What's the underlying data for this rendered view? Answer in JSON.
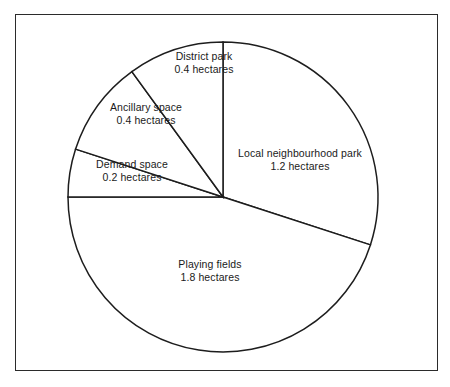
{
  "figure": {
    "caption": "",
    "units": "hectares",
    "frame": true
  },
  "chart_data": {
    "type": "pie",
    "title": "",
    "xlabel": "",
    "ylabel": "",
    "unit": "hectares",
    "total": 4.0,
    "start_angle_deg": 0,
    "direction": "clockwise",
    "legend": "none",
    "grid": false,
    "categories": [
      "Local neighbourhood park",
      "Playing fields",
      "Demand space",
      "Ancillary space",
      "District park"
    ],
    "values": [
      1.2,
      1.8,
      0.2,
      0.4,
      0.4
    ],
    "slices": [
      {
        "name": "Local neighbourhood park",
        "value": 1.2,
        "value_label": "1.2 hectares",
        "share_pct": 30,
        "angle_deg": 108,
        "start_deg": 0,
        "end_deg": 108,
        "color": "#ffffff"
      },
      {
        "name": "Playing fields",
        "value": 1.8,
        "value_label": "1.8 hectares",
        "share_pct": 45,
        "angle_deg": 162,
        "start_deg": 108,
        "end_deg": 270,
        "color": "#ffffff"
      },
      {
        "name": "Demand space",
        "value": 0.2,
        "value_label": "0.2 hectares",
        "share_pct": 5,
        "angle_deg": 18,
        "start_deg": 270,
        "end_deg": 288,
        "color": "#ffffff"
      },
      {
        "name": "Ancillary space",
        "value": 0.4,
        "value_label": "0.4 hectares",
        "share_pct": 10,
        "angle_deg": 36,
        "start_deg": 288,
        "end_deg": 324,
        "color": "#ffffff"
      },
      {
        "name": "District park",
        "value": 0.4,
        "value_label": "0.4 hectares",
        "share_pct": 10,
        "angle_deg": 36,
        "start_deg": 324,
        "end_deg": 360,
        "color": "#ffffff"
      }
    ],
    "style": {
      "stroke": "#1d1d1d",
      "fill": "#ffffff",
      "frame_stroke": "#2b2b2b",
      "text_color": "#1a1a1a"
    },
    "geometry": {
      "center_x": 223,
      "center_y": 197,
      "radius": 155
    }
  }
}
